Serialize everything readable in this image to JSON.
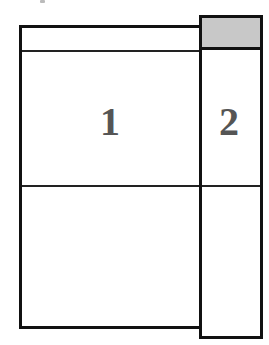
{
  "diagram": {
    "panels": [
      {
        "id": 1,
        "label": "1",
        "header_fill": "#ffffff"
      },
      {
        "id": 2,
        "label": "2",
        "header_fill": "#c8c8c8"
      }
    ],
    "colors": {
      "border": "#111111",
      "label": "#555555",
      "header_shaded": "#c8c8c8"
    }
  }
}
